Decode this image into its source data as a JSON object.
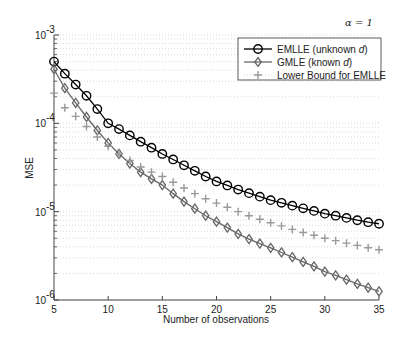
{
  "chart_data": {
    "type": "line",
    "title": "",
    "annotation": "α = 1",
    "xlabel": "Number of observations",
    "ylabel": "MSE",
    "yscale": "log",
    "xlim": [
      5,
      35
    ],
    "ylim": [
      1e-06,
      0.001
    ],
    "grid": true,
    "legend_position": "upper right",
    "x_ticks": [
      5,
      10,
      15,
      20,
      25,
      30,
      35
    ],
    "y_ticks": [
      1e-06,
      1e-05,
      0.0001,
      0.001
    ],
    "y_tick_labels": [
      {
        "base": "10",
        "exp": "-6"
      },
      {
        "base": "10",
        "exp": "-5"
      },
      {
        "base": "10",
        "exp": "-4"
      },
      {
        "base": "10",
        "exp": "-3"
      }
    ],
    "x": [
      5,
      6,
      7,
      8,
      9,
      10,
      11,
      12,
      13,
      14,
      15,
      16,
      17,
      18,
      19,
      20,
      21,
      22,
      23,
      24,
      25,
      26,
      27,
      28,
      29,
      30,
      31,
      32,
      33,
      34,
      35
    ],
    "series": [
      {
        "name": "EMLLE (unknown d)",
        "label_main": "EMLLE (unknown ",
        "label_italic": "d",
        "label_end": ")",
        "marker": "circle",
        "color": "#000000",
        "values": [
          0.0005,
          0.000365,
          0.000275,
          0.000205,
          0.000145,
          0.0001,
          8.6e-05,
          7.3e-05,
          6.2e-05,
          5.3e-05,
          4.5e-05,
          3.9e-05,
          3.35e-05,
          2.9e-05,
          2.5e-05,
          2.2e-05,
          1.98e-05,
          1.78e-05,
          1.62e-05,
          1.48e-05,
          1.35e-05,
          1.26e-05,
          1.17e-05,
          1.09e-05,
          1.02e-05,
          9.5e-06,
          9e-06,
          8.5e-06,
          8e-06,
          7.6e-06,
          7.3e-06
        ]
      },
      {
        "name": "GMLE (known d)",
        "label_main": "GMLE (known ",
        "label_italic": "d",
        "label_end": ")",
        "marker": "diamond",
        "color": "#666666",
        "values": [
          0.00041,
          0.00025,
          0.00017,
          0.000118,
          8.3e-05,
          6e-05,
          4.5e-05,
          3.5e-05,
          2.8e-05,
          2.35e-05,
          2e-05,
          1.6e-05,
          1.3e-05,
          1.08e-05,
          9e-06,
          7.7e-06,
          6.6e-06,
          5.6e-06,
          4.9e-06,
          4.35e-06,
          3.9e-06,
          3.45e-06,
          3.05e-06,
          2.7e-06,
          2.4e-06,
          2.1e-06,
          1.9e-06,
          1.7e-06,
          1.52e-06,
          1.38e-06,
          1.25e-06
        ]
      },
      {
        "name": "Lower Bound for EMLLE",
        "label_main": "Lower Bound for EMLLE",
        "label_italic": "",
        "label_end": "",
        "marker": "plus",
        "color": "#999999",
        "values": [
          0.00022,
          0.00015,
          0.00012,
          9.2e-05,
          7e-05,
          5.5e-05,
          4.5e-05,
          3.8e-05,
          3.2e-05,
          2.8e-05,
          2.5e-05,
          2.15e-05,
          1.85e-05,
          1.6e-05,
          1.4e-05,
          1.25e-05,
          1.12e-05,
          1e-05,
          9e-06,
          8.2e-06,
          7.5e-06,
          6.9e-06,
          6.3e-06,
          5.8e-06,
          5.4e-06,
          5e-06,
          4.7e-06,
          4.4e-06,
          4.15e-06,
          3.9e-06,
          3.7e-06
        ]
      }
    ]
  }
}
